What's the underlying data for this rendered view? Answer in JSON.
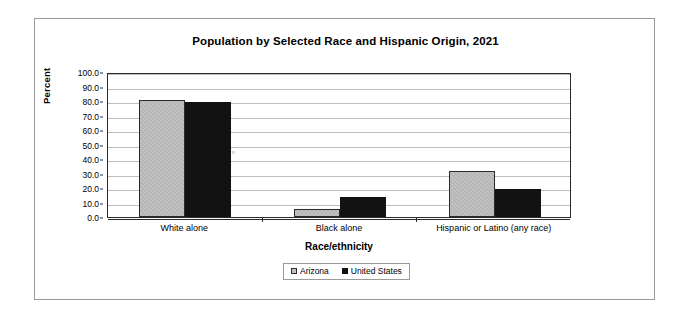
{
  "chart_data": {
    "type": "bar",
    "title": "Population by Selected Race and Hispanic Origin, 2021",
    "xlabel": "Race/ethnicity",
    "ylabel": "Percent",
    "categories": [
      "White alone",
      "Black alone",
      "Hispanic or Latino (any race)"
    ],
    "series": [
      {
        "name": "Arizona",
        "color": "#b4b4b4",
        "values": [
          81.0,
          5.5,
          32.0
        ]
      },
      {
        "name": "United States",
        "color": "#121212",
        "values": [
          79.0,
          14.0,
          19.0
        ]
      }
    ],
    "ylim": [
      0.0,
      100.0
    ],
    "ytick_step": 10.0,
    "ytick_labels": [
      "0.0",
      "10.0",
      "20.0",
      "30.0",
      "40.0",
      "50.0",
      "60.0",
      "70.0",
      "80.0",
      "90.0",
      "100.0"
    ],
    "grid": true,
    "legend_position": "bottom-center"
  },
  "legend": {
    "items": [
      {
        "label": "Arizona"
      },
      {
        "label": "United States"
      }
    ]
  }
}
